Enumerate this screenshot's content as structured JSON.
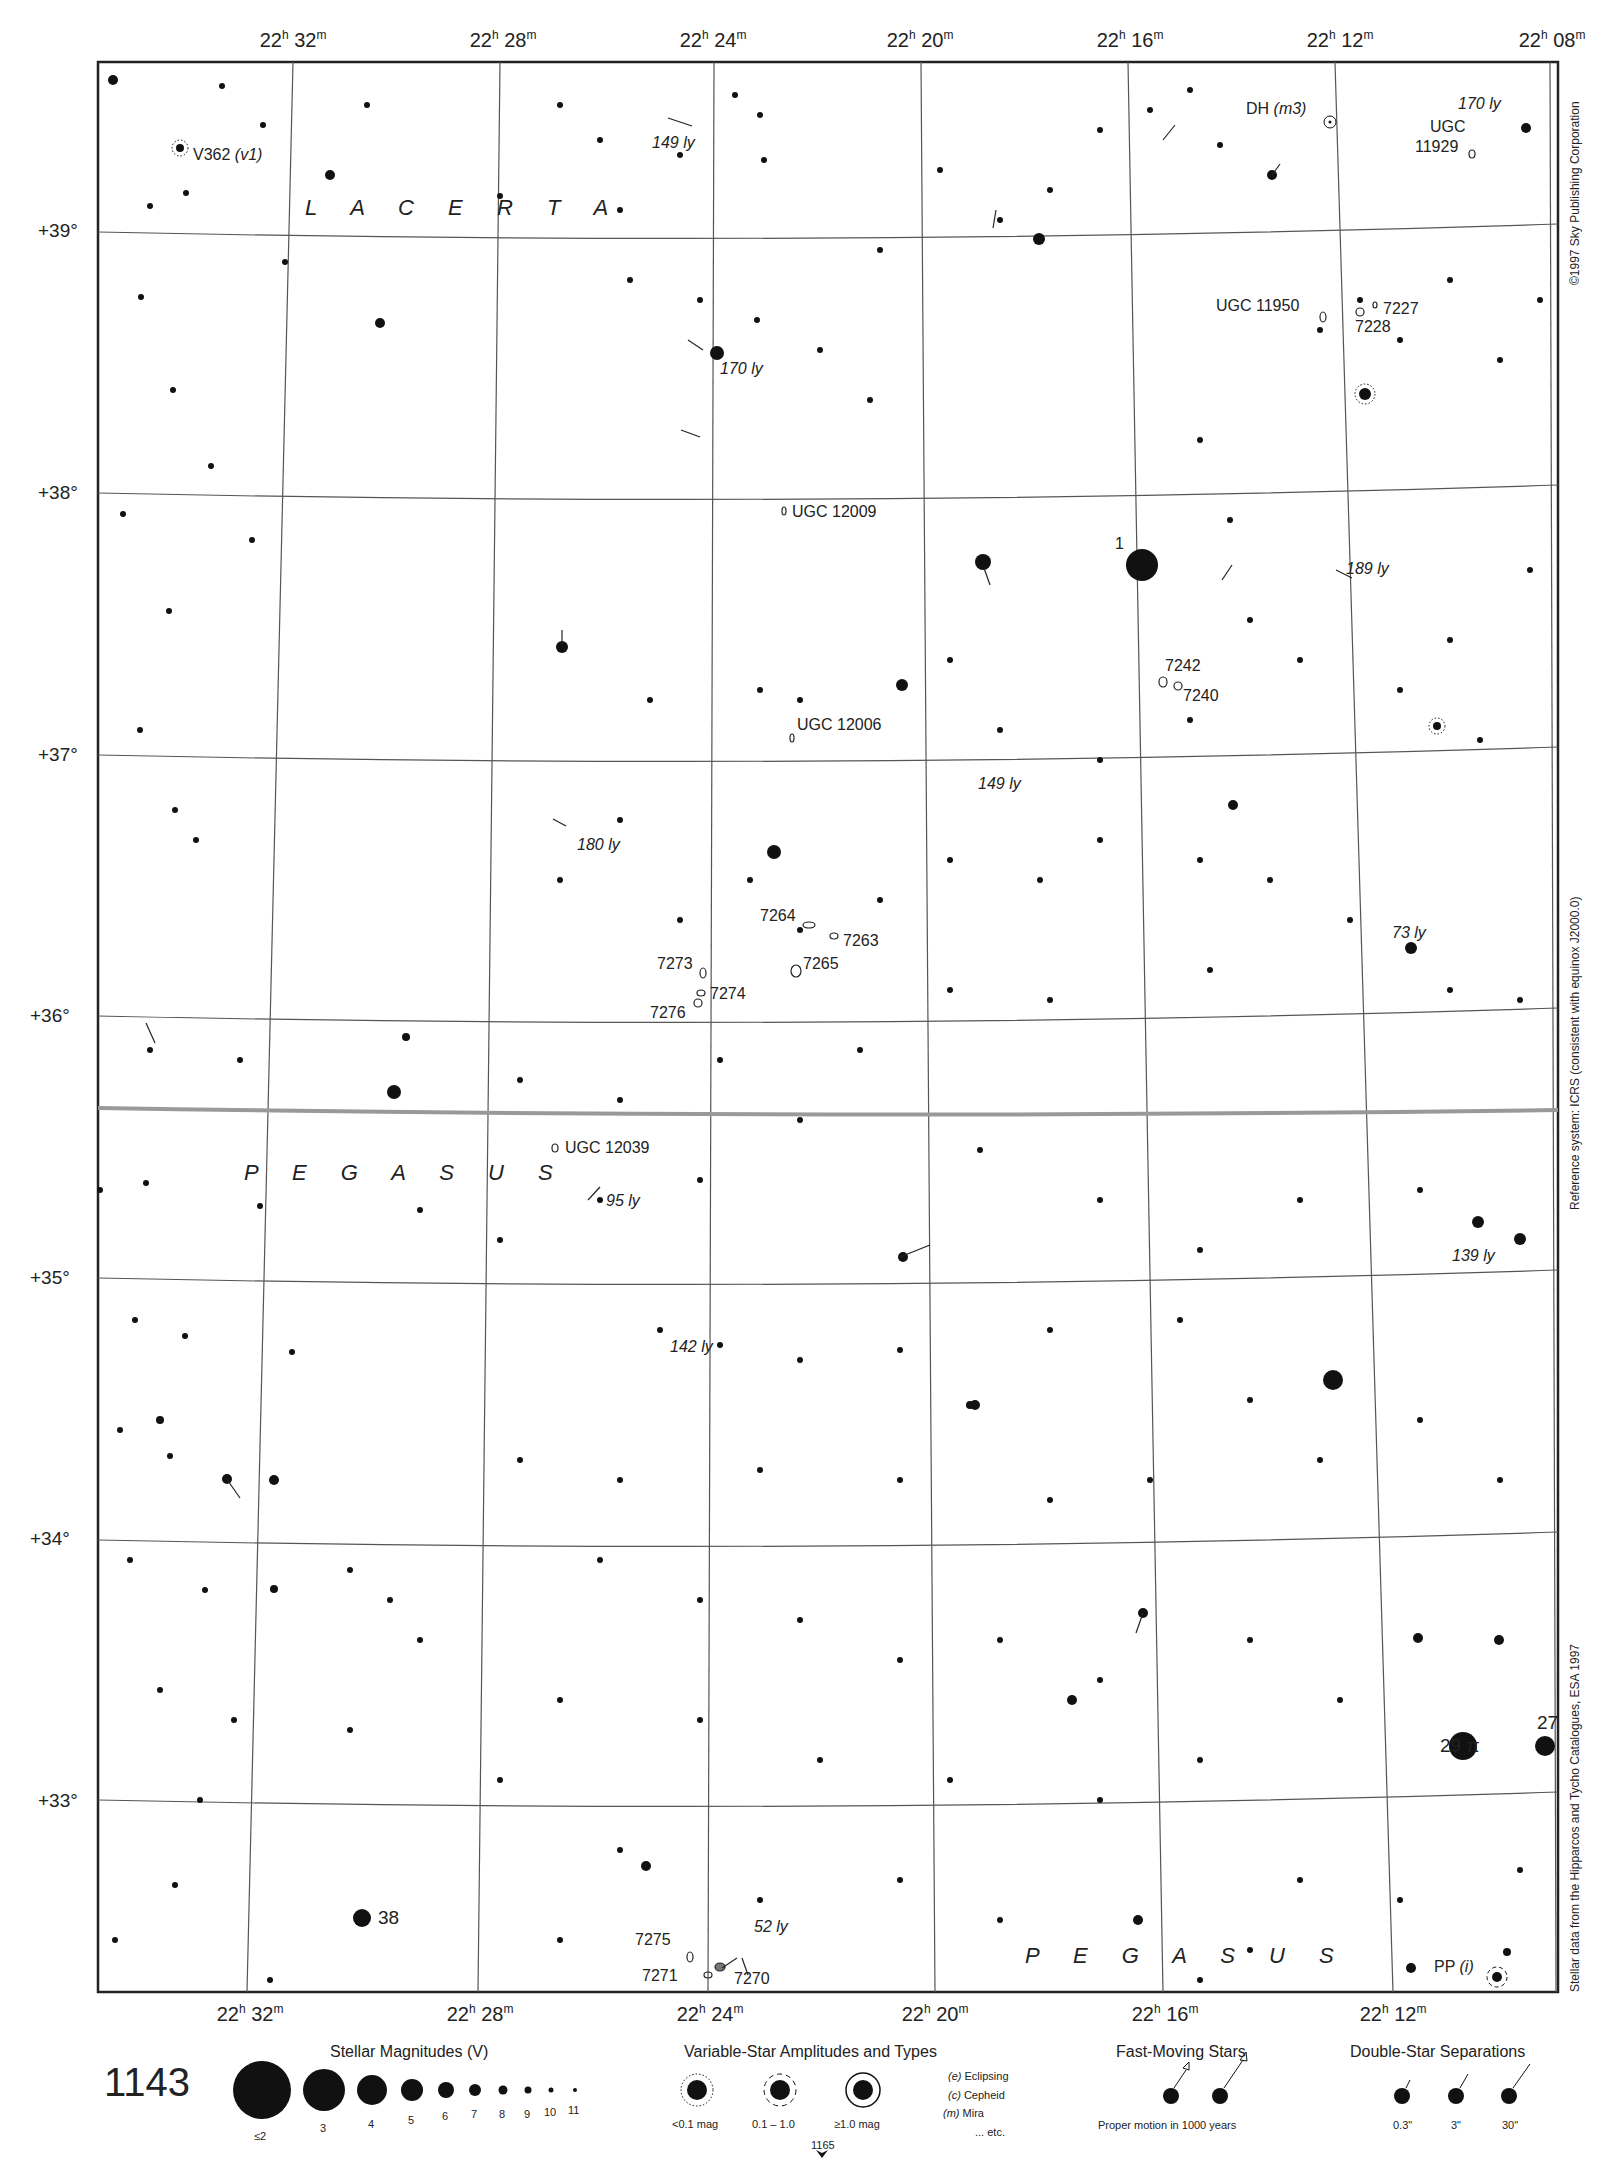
{
  "page": {
    "chart_number": "1143",
    "adjacent_chart_below": "1165"
  },
  "ra_labels_top": [
    "22h 32m",
    "22h 28m",
    "22h 24m",
    "22h 20m",
    "22h 16m",
    "22h 12m",
    "22h 08m"
  ],
  "ra_labels_bottom": [
    "22h 32m",
    "22h 28m",
    "22h 24m",
    "22h 20m",
    "22h 16m",
    "22h 12m"
  ],
  "ra_top": [
    {
      "h": "22",
      "m": "32"
    },
    {
      "h": "22",
      "m": "28"
    },
    {
      "h": "22",
      "m": "24"
    },
    {
      "h": "22",
      "m": "20"
    },
    {
      "h": "22",
      "m": "16"
    },
    {
      "h": "22",
      "m": "12"
    },
    {
      "h": "22",
      "m": "08"
    }
  ],
  "ra_bottom": [
    {
      "h": "22",
      "m": "32"
    },
    {
      "h": "22",
      "m": "28"
    },
    {
      "h": "22",
      "m": "24"
    },
    {
      "h": "22",
      "m": "20"
    },
    {
      "h": "22",
      "m": "16"
    },
    {
      "h": "22",
      "m": "12"
    }
  ],
  "dec_labels": [
    "+39°",
    "+38°",
    "+37°",
    "+36°",
    "+35°",
    "+34°",
    "+33°"
  ],
  "constellations": {
    "lacerta": "L A C E R T A",
    "pegasus_mid": "P E G A S U S",
    "pegasus_bottom": "P E G A S U S"
  },
  "object_labels": {
    "v362": "V362",
    "v362_type": "(v1)",
    "dh": "DH",
    "dh_type": "(m3)",
    "ugc11929_a": "UGC",
    "ugc11929_b": "11929",
    "ly170_top": "170 ly",
    "ly149_top": "149 ly",
    "ugc11950": "UGC 11950",
    "n7227": "7227",
    "n7228": "7228",
    "ly170_mid": "170 ly",
    "ugc12009": "UGC 12009",
    "star1": "1",
    "ly189": "189 ly",
    "n7242": "7242",
    "n7240": "7240",
    "ugc12006": "UGC 12006",
    "ly149_mid": "149 ly",
    "ly180": "180 ly",
    "n7264": "7264",
    "n7263": "7263",
    "n7265": "7265",
    "n7273": "7273",
    "n7274": "7274",
    "n7276": "7276",
    "ly73": "73 ly",
    "ugc12039": "UGC 12039",
    "ly95": "95 ly",
    "ly139": "139 ly",
    "ly142": "142 ly",
    "star29": "29 π",
    "star27": "27",
    "star38": "38",
    "n7275": "7275",
    "n7271": "7271",
    "n7270": "7270",
    "ly52": "52 ly",
    "pp": "PP",
    "pp_type": "(i)"
  },
  "side_text": {
    "copyright": "©1997 Sky Publishing Corporation",
    "reference": "Reference system: ICRS (consistent with equinox J2000.0)",
    "stellar_data": "Stellar data from the Hipparcos and Tycho Catalogues, ESA 1997"
  },
  "legend": {
    "magnitudes_title": "Stellar Magnitudes (V)",
    "magnitudes": [
      "≤2",
      "3",
      "4",
      "5",
      "6",
      "7",
      "8",
      "9",
      "10",
      "11"
    ],
    "variables_title": "Variable-Star Amplitudes and Types",
    "variable_amplitudes": [
      "<0.1 mag",
      "0.1 – 1.0",
      "≥1.0 mag"
    ],
    "variable_types": [
      {
        "code": "(e)",
        "name": "Eclipsing"
      },
      {
        "code": "(c)",
        "name": "Cepheid"
      },
      {
        "code": "(m)",
        "name": "Mira"
      },
      {
        "code": "",
        "name": "... etc."
      }
    ],
    "fast_title": "Fast-Moving Stars",
    "fast_caption": "Proper motion in 1000 years",
    "double_title": "Double-Star Separations",
    "double_seps": [
      "0.3\"",
      "3\"",
      "30\""
    ]
  }
}
